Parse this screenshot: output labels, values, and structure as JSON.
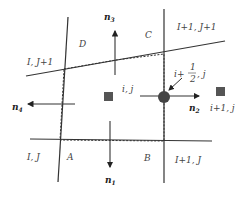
{
  "diagram": {
    "corners": {
      "A": "A",
      "B": "B",
      "C": "C",
      "D": "D"
    },
    "cells": {
      "top_left": "I, J+1",
      "top_right": "I+1, J+1",
      "bottom_left": "I, J",
      "bottom_right": "I+1, J"
    },
    "centers": {
      "current": "i, j",
      "neighbor": "i+1, j",
      "face_prefix": "i+",
      "face_num": "1",
      "face_den": "2",
      "face_suffix": ", j"
    },
    "normals": {
      "n1": {
        "base": "n",
        "sub": "1"
      },
      "n2": {
        "base": "n",
        "sub": "2"
      },
      "n3": {
        "base": "n",
        "sub": "3"
      },
      "n4": {
        "base": "n",
        "sub": "4"
      }
    },
    "colors": {
      "line": "#333333",
      "node": "#555555",
      "face_node": "#444444"
    }
  }
}
